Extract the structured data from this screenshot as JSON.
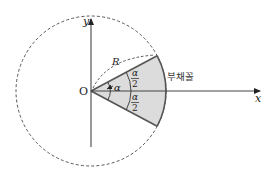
{
  "diagram": {
    "labels": {
      "origin": "O",
      "x_axis": "x",
      "y_axis": "y",
      "radius": "R",
      "angle": "α",
      "half_angle_num": "α",
      "half_angle_den": "2",
      "sector": "부채꼴"
    },
    "colors": {
      "sector_fill": "#dcdcdc",
      "stroke": "#333333",
      "dashed": "#444444",
      "background": "#ffffff"
    },
    "geometry": {
      "origin": [
        91,
        91
      ],
      "circle_radius": 75,
      "sector_half_angle_deg": 28
    }
  }
}
